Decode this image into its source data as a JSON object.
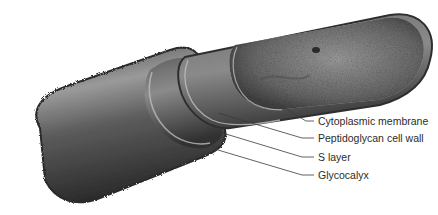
{
  "diagram": {
    "colors": {
      "background": "#ffffff",
      "cell_dark": "#2e2e2e",
      "cell_mid": "#6a6a6a",
      "cell_light": "#b5b5b5",
      "leader_line": "#3a3a3a",
      "label_text": "#2b2b2b"
    },
    "labels": [
      {
        "id": "cytoplasmic-membrane",
        "text": "Cytoplasmic membrane",
        "x": 318,
        "y": 115
      },
      {
        "id": "peptidoglycan-cell-wall",
        "text": "Peptidoglycan cell wall",
        "x": 318,
        "y": 132
      },
      {
        "id": "s-layer",
        "text": "S layer",
        "x": 318,
        "y": 151
      },
      {
        "id": "glycocalyx",
        "text": "Glycocalyx",
        "x": 318,
        "y": 169
      }
    ]
  }
}
